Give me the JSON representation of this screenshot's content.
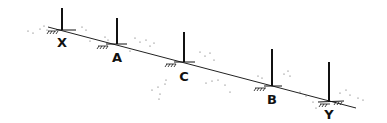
{
  "diagram": {
    "line": {
      "from": [
        62,
        30
      ],
      "to": [
        352,
        107
      ],
      "color": "#222222"
    },
    "posts": [
      {
        "label": "X",
        "x": 62,
        "top": 8,
        "base": 30,
        "label_y": 47
      },
      {
        "label": "A",
        "x": 117,
        "top": 18,
        "base": 44,
        "label_y": 62
      },
      {
        "label": "C",
        "x": 184,
        "top": 32,
        "base": 62,
        "label_y": 81
      },
      {
        "label": "B",
        "x": 272,
        "top": 49,
        "base": 86,
        "label_y": 104
      },
      {
        "label": "Y",
        "x": 329,
        "top": 62,
        "base": 102,
        "label_y": 119
      }
    ],
    "colors": {
      "ink": "#111111",
      "speckle": "#777777"
    }
  }
}
